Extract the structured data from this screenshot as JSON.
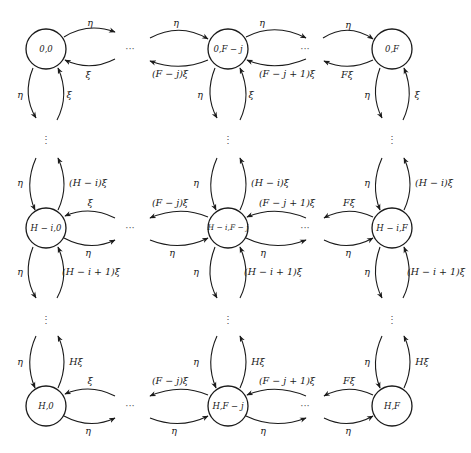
{
  "diagram": {
    "type": "state-transition-diagram",
    "nodes": [
      {
        "id": "n00",
        "label": "0,0",
        "cx": 46,
        "cy": 49
      },
      {
        "id": "n0j",
        "label": "0,F − j",
        "cx": 228,
        "cy": 49
      },
      {
        "id": "n0F",
        "label": "0,F",
        "cx": 392,
        "cy": 49
      },
      {
        "id": "ni0",
        "label": "H − i,0",
        "cx": 46,
        "cy": 228
      },
      {
        "id": "nij",
        "label": "H − i,F − j",
        "cx": 228,
        "cy": 228
      },
      {
        "id": "niF",
        "label": "H − i,F",
        "cx": 392,
        "cy": 228
      },
      {
        "id": "nH0",
        "label": "H,0",
        "cx": 46,
        "cy": 406
      },
      {
        "id": "nHj",
        "label": "H,F − j",
        "cx": 228,
        "cy": 406
      },
      {
        "id": "nHF",
        "label": "H,F",
        "cx": 392,
        "cy": 406
      }
    ],
    "edge_labels": {
      "eta": "η",
      "xi": "ξ",
      "F_minus_j_xi": "(F − j)ξ",
      "F_minus_j_plus_1_xi": "(F − j + 1)ξ",
      "F_xi": "Fξ",
      "H_minus_i_xi": "(H − i)ξ",
      "H_minus_i_plus_1_xi": "(H − i + 1)ξ",
      "H_xi": "Hξ"
    },
    "ellipsis_h": "···",
    "ellipsis_v": "⋮"
  }
}
